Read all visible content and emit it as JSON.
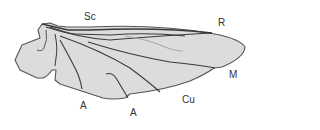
{
  "diagram": {
    "colors": {
      "wing_fill": "#dcdcdc",
      "outline": "#555555",
      "vein": "#3a3a3a",
      "faint_vein": "#aaaaaa",
      "label": "#333333"
    },
    "labels": [
      {
        "id": "sc",
        "text": "Sc",
        "x": 84,
        "y": 12
      },
      {
        "id": "r",
        "text": "R",
        "x": 218,
        "y": 18
      },
      {
        "id": "m",
        "text": "M",
        "x": 230,
        "y": 70
      },
      {
        "id": "cu",
        "text": "Cu",
        "x": 183,
        "y": 95
      },
      {
        "id": "a1",
        "text": "A",
        "x": 81,
        "y": 101
      },
      {
        "id": "a2",
        "text": "A",
        "x": 131,
        "y": 108
      }
    ]
  }
}
